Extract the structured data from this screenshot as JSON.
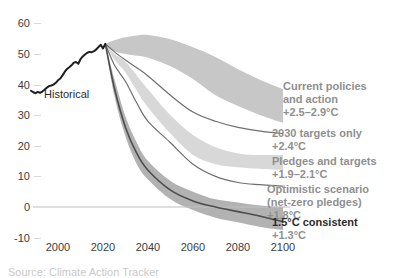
{
  "chart_data": {
    "type": "line",
    "title": "",
    "xlabel": "",
    "ylabel": "",
    "grid": false,
    "xlim": [
      1985,
      2107
    ],
    "ylim": [
      -12,
      62
    ],
    "x_ticks": [
      2000,
      2020,
      2040,
      2060,
      2080,
      2100
    ],
    "y_ticks": [
      60,
      50,
      40,
      30,
      20,
      10,
      0,
      -10
    ],
    "zero_line": true,
    "historical": {
      "label": "Historical",
      "years": [
        1988,
        1989,
        1990,
        1991,
        1992,
        1993,
        1994,
        1995,
        1996,
        1997,
        1998,
        1999,
        2000,
        2001,
        2002,
        2003,
        2004,
        2005,
        2006,
        2007,
        2008,
        2009,
        2010,
        2011,
        2012,
        2013,
        2014,
        2015,
        2016,
        2017,
        2018,
        2019,
        2020,
        2021
      ],
      "values": [
        38.0,
        37.5,
        37.2,
        37.6,
        37.3,
        37.7,
        38.3,
        39.0,
        39.5,
        39.7,
        40.0,
        40.6,
        41.4,
        42.0,
        43.0,
        44.2,
        45.1,
        45.7,
        46.3,
        47.2,
        47.4,
        46.8,
        48.3,
        49.2,
        49.8,
        50.4,
        50.7,
        50.6,
        50.9,
        51.5,
        52.3,
        53.0,
        51.8,
        53.3
      ],
      "label_pos": {
        "x": 44,
        "y": 88
      }
    },
    "scenario_years": [
      2021,
      2025,
      2030,
      2035,
      2040,
      2050,
      2060,
      2070,
      2080,
      2090,
      2100
    ],
    "scenarios": [
      {
        "id": "current-policies",
        "label_lines": [
          "Current policies",
          "and action"
        ],
        "temp": "+2.5–2.9°C",
        "kind": "band",
        "upper": [
          53.3,
          54.5,
          55.5,
          56.0,
          56.2,
          54.8,
          52.2,
          49.0,
          45.0,
          41.5,
          38.5
        ],
        "lower": [
          53.3,
          51.0,
          50.0,
          49.4,
          48.8,
          46.0,
          41.8,
          36.5,
          33.0,
          30.0,
          27.5
        ],
        "label_pos": {
          "x": 283,
          "y": 80
        },
        "emphasis": false
      },
      {
        "id": "targets-2030",
        "label_lines": [
          "2030 targets only"
        ],
        "temp": "+2.4°C",
        "kind": "line",
        "values": [
          53.3,
          50.8,
          48.0,
          45.5,
          42.8,
          36.5,
          31.0,
          28.0,
          26.0,
          24.8,
          24.0
        ],
        "label_pos": {
          "x": 272,
          "y": 127
        },
        "emphasis": false
      },
      {
        "id": "pledges-and-targets",
        "label_lines": [
          "Pledges and targets"
        ],
        "temp": "+1.9–2.1°C",
        "kind": "band",
        "upper": [
          53.3,
          50.2,
          47.5,
          43.0,
          38.5,
          30.0,
          23.5,
          19.5,
          17.5,
          17.0,
          17.0
        ],
        "lower": [
          53.3,
          48.2,
          44.0,
          38.0,
          32.5,
          24.0,
          17.0,
          14.0,
          13.0,
          12.5,
          12.0
        ],
        "label_pos": {
          "x": 272,
          "y": 155
        },
        "emphasis": false
      },
      {
        "id": "optimistic-net-zero",
        "label_lines": [
          "Optimistic scenario",
          "(net-zero pledges)"
        ],
        "temp": "+1.8°C",
        "kind": "line",
        "values": [
          53.3,
          46.5,
          41.0,
          34.0,
          28.0,
          21.0,
          14.0,
          10.0,
          8.0,
          7.3,
          6.8
        ],
        "label_pos": {
          "x": 267,
          "y": 183
        },
        "emphasis": false
      },
      {
        "id": "one-point-five-consistent",
        "label_lines": [
          "1.5°C consistent"
        ],
        "temp": "+1.3°C",
        "kind": "band-line",
        "upper": [
          53.3,
          42.0,
          29.5,
          21.0,
          15.0,
          8.5,
          5.0,
          2.5,
          1.5,
          0.5,
          0.0
        ],
        "median": [
          53.3,
          39.0,
          26.0,
          17.5,
          12.0,
          5.5,
          2.0,
          0.0,
          -1.5,
          -3.0,
          -4.8
        ],
        "lower": [
          53.3,
          36.5,
          23.0,
          14.0,
          9.0,
          2.5,
          -1.0,
          -3.5,
          -5.0,
          -6.5,
          -7.5
        ],
        "label_pos": {
          "x": 272,
          "y": 216
        },
        "emphasis": true
      }
    ],
    "source_note_clipped": "Source: Climate Action Tracker",
    "colors": {
      "background": "#ffffff",
      "historical_line": "#1f1f1f",
      "scenario_line": "#6f6f6f",
      "current_policies_band": "#c7c7c7",
      "pledges_band": "#d8d8d8",
      "one_point_five_band": "#b2b2b2",
      "one_point_five_line": "#4d4d4d",
      "zero_line": "#bfbfbf",
      "axis_text": "#3d3d3d",
      "label_gray": "#8f8f8f",
      "label_dark": "#2b2b2b",
      "tick_mark": "#dadada"
    }
  }
}
